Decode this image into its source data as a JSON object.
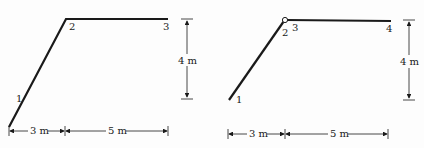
{
  "figures": [
    {
      "name": "left-truss",
      "nodes": {
        "n1": "1",
        "n2": "2",
        "n3": "3"
      },
      "dims": {
        "horizontal_a": "3 m",
        "horizontal_b": "5 m",
        "vertical": "4 m"
      }
    },
    {
      "name": "right-truss",
      "nodes": {
        "n1": "1",
        "n2": "2",
        "n3": "3",
        "n4": "4"
      },
      "dims": {
        "horizontal_a": "3 m",
        "horizontal_b": "5 m",
        "vertical": "4 m"
      }
    }
  ],
  "colors": {
    "line": "#1a1a1a",
    "background": "#fdfdfd"
  }
}
